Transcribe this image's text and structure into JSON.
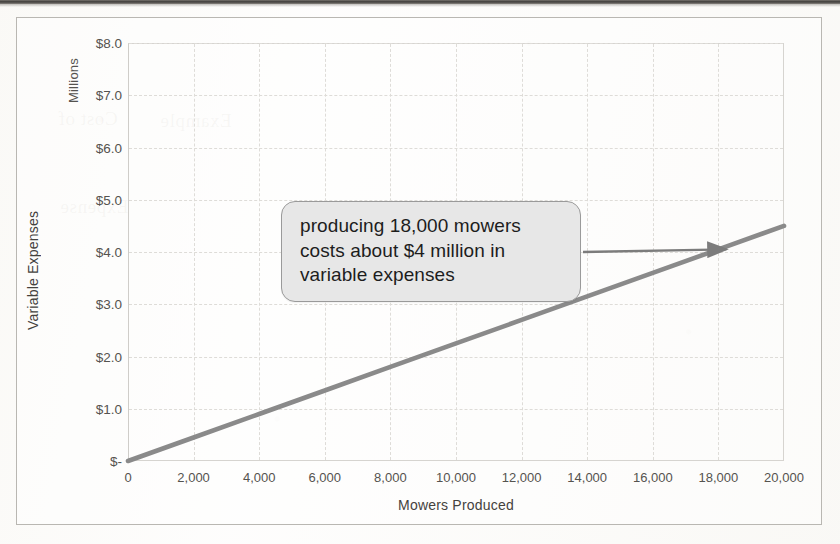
{
  "chart_data": {
    "type": "line",
    "title": "",
    "xlabel": "Mowers Produced",
    "ylabel": "Variable Expenses",
    "y_unit_label": "Millions",
    "xlim": [
      0,
      20000
    ],
    "ylim": [
      0,
      8
    ],
    "grid": true,
    "legend": "none",
    "x_ticks": [
      "0",
      "2,000",
      "4,000",
      "6,000",
      "8,000",
      "10,000",
      "12,000",
      "14,000",
      "16,000",
      "18,000",
      "20,000"
    ],
    "x_tick_values": [
      0,
      2000,
      4000,
      6000,
      8000,
      10000,
      12000,
      14000,
      16000,
      18000,
      20000
    ],
    "y_ticks": [
      "$-",
      "$1.0",
      "$2.0",
      "$3.0",
      "$4.0",
      "$5.0",
      "$6.0",
      "$7.0",
      "$8.0"
    ],
    "y_tick_values": [
      0,
      1,
      2,
      3,
      4,
      5,
      6,
      7,
      8
    ],
    "series": [
      {
        "name": "Variable Expenses",
        "color": "#8a8a8a",
        "x": [
          0,
          2000,
          4000,
          6000,
          8000,
          10000,
          12000,
          14000,
          16000,
          18000,
          20000
        ],
        "values": [
          0.0,
          0.45,
          0.9,
          1.35,
          1.8,
          2.25,
          2.7,
          3.15,
          3.6,
          4.05,
          4.5
        ]
      }
    ],
    "annotations": [
      {
        "name": "callout",
        "text": "producing 18,000 mowers costs about $4 million in variable expenses",
        "lines": [
          "producing 18,000 mowers",
          "costs about $4 million in",
          "variable expenses"
        ],
        "arrow": {
          "from_x": 14000,
          "from_y": 4.0,
          "to_x": 18000,
          "to_y": 4.05,
          "direction": "right"
        },
        "fill": "#e7e7e7",
        "border": "#9a9a9a"
      }
    ]
  },
  "axes": {
    "y_title": "Variable Expenses",
    "y_unit": "Millions",
    "x_title": "Mowers Produced"
  },
  "bleed_text": {
    "a": "Cost of",
    "b": "Example",
    "c": "Expense"
  }
}
